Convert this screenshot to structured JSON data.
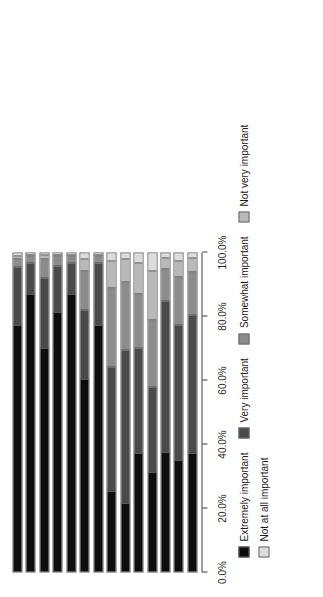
{
  "chart_data": {
    "type": "bar",
    "variant": "stacked-100-horizontal",
    "title": "",
    "xlabel": "",
    "ylabel": "",
    "xlim": [
      0,
      100
    ],
    "grid": false,
    "legend_position": "bottom",
    "tick_labels": [
      "0.0%",
      "20.0%",
      "40.0%",
      "60.0%",
      "80.0%",
      "100.0%"
    ],
    "tick_values": [
      0,
      20,
      40,
      60,
      80,
      100
    ],
    "categories": [
      "Repairing harm",
      "Victim participation",
      "Victim healing",
      "Victim satisfaction",
      "Offender participation",
      "Offender reintegration",
      "Holding offenders accountable",
      "Keeping offenders out of court",
      "Offender punishment",
      "Offender rehabilitation",
      "Reducing court backlog",
      "Community involvement",
      "Community-building",
      "Building local community capacity\nto respond to crime"
    ],
    "series": [
      {
        "name": "Extremely important",
        "color": "#0d0d0d",
        "values": [
          77.5,
          87.0,
          70.0,
          81.5,
          87.0,
          60.5,
          77.5,
          25.0,
          21.5,
          37.0,
          31.0,
          37.5,
          35.0,
          37.0
        ]
      },
      {
        "name": "Very important",
        "color": "#4a4a4a",
        "values": [
          18.0,
          10.0,
          22.0,
          14.5,
          10.0,
          21.5,
          19.5,
          39.0,
          48.0,
          33.0,
          27.0,
          47.5,
          42.5,
          43.5
        ]
      },
      {
        "name": "Somewhat important",
        "color": "#8c8c8c",
        "values": [
          2.5,
          2.0,
          6.0,
          3.0,
          2.0,
          12.5,
          2.0,
          25.0,
          21.5,
          17.0,
          21.0,
          10.0,
          15.0,
          13.5
        ]
      },
      {
        "name": "Not very important",
        "color": "#b9b9b9",
        "values": [
          1.0,
          0.5,
          1.5,
          0.5,
          0.5,
          3.5,
          0.5,
          8.5,
          7.0,
          10.0,
          15.5,
          3.5,
          5.0,
          4.5
        ]
      },
      {
        "name": "Not at all important",
        "color": "#dcdcdc",
        "values": [
          1.0,
          0.5,
          0.5,
          0.5,
          0.5,
          2.0,
          0.5,
          2.5,
          2.0,
          3.0,
          5.5,
          1.5,
          2.5,
          1.5
        ]
      }
    ]
  }
}
